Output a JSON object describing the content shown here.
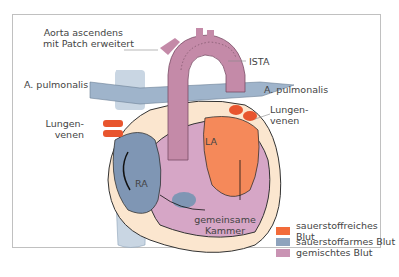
{
  "labels": {
    "aorta": [
      "Aorta ascendens",
      "mit Patch erweitert"
    ],
    "ista": "ISTA",
    "pulm_left": "A. pulmonalis",
    "pulm_right": "A. pulmonalis",
    "lungen_left": [
      "Lungen-",
      "venen"
    ],
    "lungen_right": [
      "Lungen-",
      "venen"
    ],
    "la": "LA",
    "ra": "RA",
    "kammer": [
      "gemeinsame",
      "Kammer"
    ]
  },
  "legend": [
    {
      "label": "sauerstoffreiches Blut",
      "color": "#f26b3a"
    },
    {
      "label": "sauerstoffarmes Blut",
      "color": "#8ea3bd"
    },
    {
      "label": "gemischtes Blut",
      "color": "#c993b3"
    }
  ],
  "colors": {
    "border": "#c0c0c0",
    "aorta": "#c48aa8",
    "vein": "#c9d6e3",
    "pulmonary": "#9fb4cb",
    "oxygenated": "#f5895a",
    "deoxygenated": "#7f96b4",
    "mixed": "#d6a6c6",
    "wall": "#fbe6cf"
  }
}
